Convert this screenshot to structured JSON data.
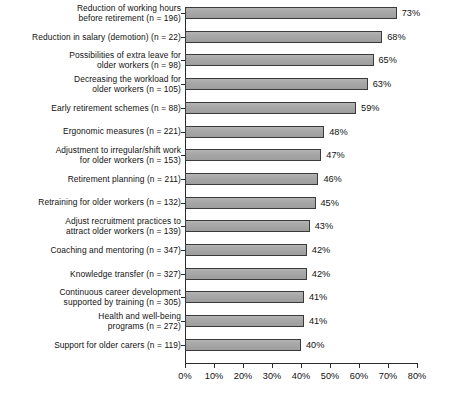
{
  "chart_data": {
    "type": "bar",
    "orientation": "horizontal",
    "title": "",
    "subtitle": "",
    "xlabel": "",
    "ylabel": "",
    "xlim": [
      0,
      80
    ],
    "xticks": [
      0,
      10,
      20,
      30,
      40,
      50,
      60,
      70,
      80
    ],
    "xtick_labels": [
      "0%",
      "10%",
      "20%",
      "30%",
      "40%",
      "50%",
      "60%",
      "70%",
      "80%"
    ],
    "grid": false,
    "legend": null,
    "value_label_suffix": "%",
    "categories": [
      "Reduction of working hours\nbefore retirement (n = 196)",
      "Reduction in salary (demotion) (n = 22)",
      "Possibilities of extra leave for\nolder workers (n = 98)",
      "Decreasing the workload for\nolder workers (n = 105)",
      "Early retirement schemes (n = 88)",
      "Ergonomic measures (n = 221)",
      "Adjustment to irregular/shift work\nfor older workers (n = 153)",
      "Retirement planning (n = 211)",
      "Retraining for older workers (n = 132)",
      "Adjust recruitment practices to\nattract older workers (n = 139)",
      "Coaching and mentoring (n = 347)",
      "Knowledge transfer (n = 327)",
      "Continuous career development\nsupported by training (n = 305)",
      "Health and well-being\nprograms (n = 272)",
      "Support for older carers (n = 119)"
    ],
    "values": [
      73,
      68,
      65,
      63,
      59,
      48,
      47,
      46,
      45,
      43,
      42,
      42,
      41,
      41,
      40
    ],
    "value_labels": [
      "73%",
      "68%",
      "65%",
      "63%",
      "59%",
      "48%",
      "47%",
      "46%",
      "45%",
      "43%",
      "42%",
      "42%",
      "41%",
      "41%",
      "40%"
    ],
    "sample_sizes": [
      196,
      22,
      98,
      105,
      88,
      221,
      153,
      211,
      132,
      139,
      347,
      327,
      305,
      272,
      119
    ],
    "colors": {
      "bar_fill": "#a6a6a6",
      "bar_border": "#3a3a3a",
      "axis": "#2b2b2b",
      "text": "#111111",
      "background": "#ffffff"
    }
  }
}
